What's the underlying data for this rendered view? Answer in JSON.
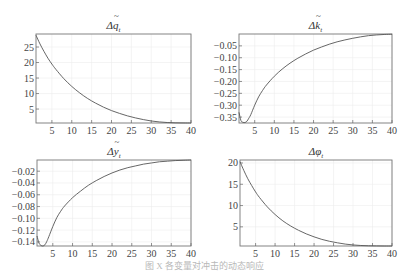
{
  "caption": "图 X  各变量对冲击的动态响应",
  "chart_data": [
    {
      "type": "line",
      "title": "Δq̃_t",
      "title_base": "Δq",
      "title_sub": "t",
      "xlabel": "",
      "ylabel": "",
      "xlim": [
        1,
        40
      ],
      "ylim": [
        0.5,
        29.2
      ],
      "xticks": [
        5,
        10,
        15,
        20,
        25,
        30,
        35,
        40
      ],
      "yticks": [
        5,
        10,
        15,
        20,
        25
      ],
      "grid": true,
      "box": {
        "x": 36,
        "y": 34,
        "w": 155,
        "h": 89
      },
      "x": [
        1,
        2,
        3,
        4,
        5,
        6,
        8,
        10,
        12,
        14,
        16,
        18,
        20,
        22,
        24,
        26,
        28,
        30,
        32,
        34,
        36,
        38,
        40
      ],
      "values": [
        28.8,
        26.0,
        23.6,
        21.4,
        19.5,
        17.8,
        14.8,
        12.3,
        10.2,
        8.4,
        6.9,
        5.6,
        4.5,
        3.6,
        2.8,
        2.15,
        1.6,
        1.15,
        0.85,
        0.65,
        0.55,
        0.52,
        0.5
      ]
    },
    {
      "type": "line",
      "title": "Δk̃_t",
      "title_base": "Δk",
      "title_sub": "t",
      "xlabel": "",
      "ylabel": "",
      "xlim": [
        1,
        40
      ],
      "ylim": [
        -0.375,
        0.0
      ],
      "xticks": [
        5,
        10,
        15,
        20,
        25,
        30,
        35,
        40
      ],
      "yticks": [
        -0.05,
        -0.1,
        -0.15,
        -0.2,
        -0.25,
        -0.3,
        -0.35
      ],
      "grid": true,
      "box": {
        "x": 239,
        "y": 34,
        "w": 153,
        "h": 89
      },
      "x": [
        1,
        1.5,
        2,
        2.5,
        3,
        3.5,
        4,
        5,
        6,
        7,
        8,
        10,
        12,
        14,
        16,
        18,
        20,
        22,
        24,
        26,
        28,
        30,
        32,
        34,
        36,
        38,
        40
      ],
      "values": [
        -0.33,
        -0.365,
        -0.372,
        -0.373,
        -0.368,
        -0.355,
        -0.34,
        -0.3,
        -0.265,
        -0.238,
        -0.215,
        -0.178,
        -0.148,
        -0.123,
        -0.102,
        -0.084,
        -0.068,
        -0.055,
        -0.043,
        -0.033,
        -0.025,
        -0.018,
        -0.012,
        -0.007,
        -0.004,
        -0.002,
        -0.001
      ]
    },
    {
      "type": "line",
      "title": "Δỹ_t",
      "title_base": "Δy",
      "title_sub": "t",
      "xlabel": "",
      "ylabel": "",
      "xlim": [
        1,
        40
      ],
      "ylim": [
        -0.147,
        -0.001
      ],
      "xticks": [
        5,
        10,
        15,
        20,
        25,
        30,
        35,
        40
      ],
      "yticks": [
        -0.02,
        -0.04,
        -0.06,
        -0.08,
        -0.1,
        -0.12,
        -0.14
      ],
      "grid": true,
      "box": {
        "x": 37,
        "y": 160,
        "w": 154,
        "h": 86
      },
      "x": [
        1,
        1.5,
        2,
        2.5,
        3,
        3.5,
        4,
        5,
        6,
        7,
        8,
        10,
        12,
        14,
        16,
        18,
        20,
        22,
        24,
        26,
        28,
        30,
        32,
        34,
        36,
        38,
        40
      ],
      "values": [
        -0.13,
        -0.142,
        -0.146,
        -0.147,
        -0.145,
        -0.139,
        -0.131,
        -0.114,
        -0.099,
        -0.088,
        -0.079,
        -0.065,
        -0.054,
        -0.044,
        -0.036,
        -0.029,
        -0.023,
        -0.018,
        -0.014,
        -0.011,
        -0.008,
        -0.006,
        -0.004,
        -0.003,
        -0.002,
        -0.0015,
        -0.001
      ]
    },
    {
      "type": "line",
      "title": "Δφ_t",
      "title_base": "Δφ",
      "title_sub": "t",
      "xlabel": "",
      "ylabel": "",
      "xlim": [
        1,
        40
      ],
      "ylim": [
        0.5,
        20.7
      ],
      "xticks": [
        5,
        10,
        15,
        20,
        25,
        30,
        35,
        40
      ],
      "yticks": [
        5,
        10,
        15,
        20
      ],
      "grid": true,
      "box": {
        "x": 240,
        "y": 160,
        "w": 152,
        "h": 86
      },
      "x": [
        1,
        2,
        3,
        4,
        5,
        6,
        8,
        10,
        12,
        14,
        16,
        18,
        20,
        22,
        24,
        26,
        28,
        30,
        32,
        34,
        36,
        38,
        40
      ],
      "values": [
        20.3,
        18.2,
        16.3,
        14.7,
        13.2,
        11.9,
        9.7,
        7.9,
        6.4,
        5.2,
        4.2,
        3.35,
        2.65,
        2.05,
        1.6,
        1.25,
        0.95,
        0.75,
        0.62,
        0.55,
        0.52,
        0.5,
        0.5
      ]
    }
  ]
}
